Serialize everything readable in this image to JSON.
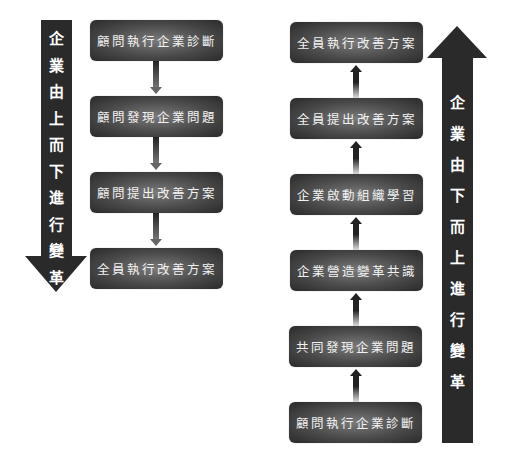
{
  "left_panel": {
    "arrow_label_chars": [
      "企",
      "業",
      "由",
      "上",
      "而",
      "下",
      "進",
      "行",
      "變",
      "革"
    ],
    "arrow_label": "企業由上而下進行變革",
    "arrow_direction": "down",
    "steps": [
      {
        "label": "顧問執行企業診斷"
      },
      {
        "label": "顧問發現企業問題"
      },
      {
        "label": "顧問提出改善方案"
      },
      {
        "label": "全員執行改善方案"
      }
    ]
  },
  "right_panel": {
    "arrow_label_chars": [
      "企",
      "業",
      "由",
      "下",
      "而",
      "上",
      "進",
      "行",
      "變",
      "革"
    ],
    "arrow_label": "企業由下而上進行變革",
    "arrow_direction": "up",
    "steps_top_to_bottom": [
      {
        "label": "全員執行改善方案"
      },
      {
        "label": "全員提出改善方案"
      },
      {
        "label": "企業啟動組織學習"
      },
      {
        "label": "企業營造變革共識"
      },
      {
        "label": "共同發現企業問題"
      },
      {
        "label": "顧問執行企業診斷"
      }
    ]
  },
  "colors": {
    "arrow": "#2a2a2a",
    "box_center": "#7a7a7a",
    "box_edge": "#2a2a2a",
    "text": "#f2f2f2",
    "background": "#ffffff"
  }
}
